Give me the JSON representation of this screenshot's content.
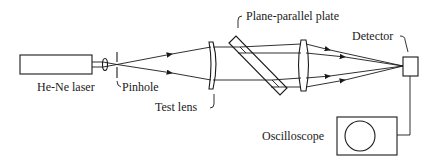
{
  "diagram": {
    "labels": {
      "laser": "He-Ne laser",
      "pinhole": "Pinhole",
      "test_lens": "Test lens",
      "plate": "Plane-parallel plate",
      "detector": "Detector",
      "oscilloscope": "Oscilloscope"
    },
    "colors": {
      "line": "#1a1a1a",
      "background": "#ffffff"
    }
  }
}
